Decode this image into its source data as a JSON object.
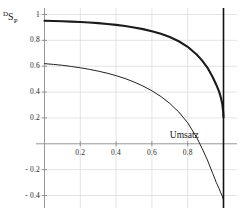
{
  "chart_data": {
    "type": "line",
    "title": "",
    "xlabel": "Umsatz",
    "ylabel": "DSP",
    "ylabel_parts": {
      "super": "D",
      "base": "S",
      "sub": "P"
    },
    "xlim": [
      0,
      1.06
    ],
    "ylim": [
      -0.47,
      1.05
    ],
    "grid": true,
    "legend": "none",
    "x_ticks": [
      0.2,
      0.4,
      0.6,
      0.8
    ],
    "x_tick_labels": [
      "0.2",
      "0.4",
      "0.6",
      "0.8"
    ],
    "y_ticks": [
      1,
      0.8,
      0.6,
      0.4,
      0.2,
      -0.2,
      -0.4
    ],
    "y_tick_labels": [
      "1",
      "0.8",
      "0.6",
      "0.4",
      "0.2",
      "- 0.2",
      "- 0.4"
    ],
    "annotations": [
      {
        "name": "vertical-asymptote",
        "x": 1.0,
        "kind": "vline",
        "color": "#111111"
      }
    ],
    "series": [
      {
        "name": "upper-curve",
        "style": "thick",
        "color": "#1b1b1b",
        "width": 2.1,
        "x": [
          0.0,
          0.05,
          0.1,
          0.15,
          0.2,
          0.25,
          0.3,
          0.35,
          0.4,
          0.45,
          0.5,
          0.55,
          0.6,
          0.65,
          0.7,
          0.75,
          0.8,
          0.85,
          0.88,
          0.91,
          0.94,
          0.96,
          0.975,
          0.985,
          0.993,
          0.998,
          1.0
        ],
        "y": [
          0.952,
          0.95,
          0.948,
          0.945,
          0.942,
          0.938,
          0.933,
          0.927,
          0.92,
          0.911,
          0.9,
          0.887,
          0.871,
          0.851,
          0.826,
          0.793,
          0.75,
          0.69,
          0.645,
          0.59,
          0.515,
          0.455,
          0.405,
          0.36,
          0.31,
          0.25,
          0.205
        ]
      },
      {
        "name": "lower-curve",
        "style": "thin",
        "color": "#222222",
        "width": 1.0,
        "x": [
          0.0,
          0.05,
          0.1,
          0.15,
          0.2,
          0.25,
          0.3,
          0.35,
          0.4,
          0.45,
          0.5,
          0.55,
          0.6,
          0.65,
          0.7,
          0.75,
          0.8,
          0.85,
          0.88,
          0.91,
          0.94,
          0.96,
          0.975,
          0.985,
          0.993,
          0.998,
          1.0
        ],
        "y": [
          0.62,
          0.614,
          0.607,
          0.598,
          0.588,
          0.576,
          0.562,
          0.546,
          0.527,
          0.505,
          0.478,
          0.447,
          0.41,
          0.366,
          0.312,
          0.246,
          0.162,
          0.05,
          -0.035,
          -0.125,
          -0.23,
          -0.3,
          -0.345,
          -0.38,
          -0.405,
          -0.425,
          -0.435
        ]
      }
    ],
    "colors": {
      "axis": "#8c8c8c",
      "grid": "#d8d8d8",
      "curve": "#1b1b1b",
      "text": "#1a1a1a"
    }
  }
}
